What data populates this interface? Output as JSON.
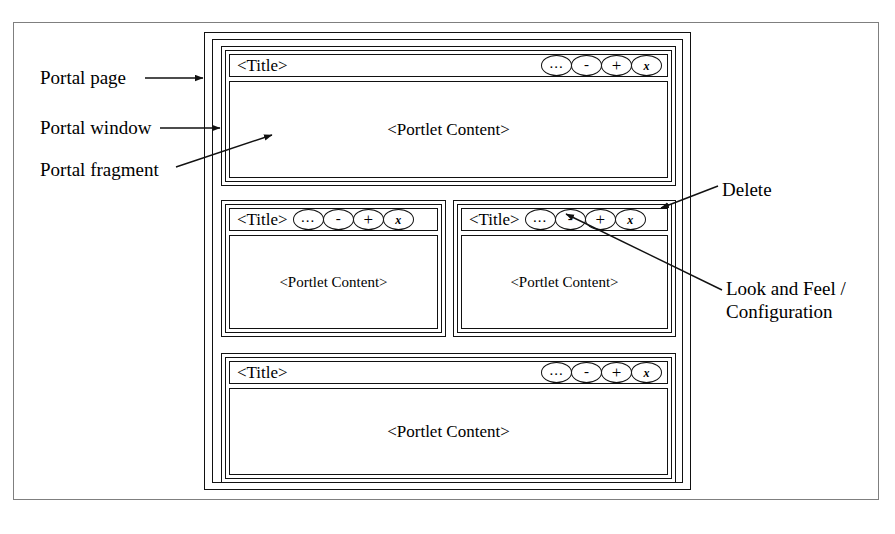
{
  "diagram": {
    "colors": {
      "stroke": "#111111",
      "page_border": "#7f7f7f",
      "background": "#ffffff"
    },
    "annotations": [
      {
        "id": "portal-page",
        "text": "Portal page",
        "points_to": "portal-page-frame"
      },
      {
        "id": "portal-window",
        "text": "Portal window",
        "points_to": "portal-window-border"
      },
      {
        "id": "portal-fragment",
        "text": "Portal fragment",
        "points_to": "portlet-content-area"
      },
      {
        "id": "delete",
        "text": "Delete",
        "points_to": "close-button"
      },
      {
        "id": "look-and-feel",
        "text_line1": "Look and Feel /",
        "text_line2": "Configuration",
        "points_to": "options-button"
      }
    ],
    "buttons": [
      {
        "name": "options-button",
        "label": "...",
        "title": "Look and Feel / Configuration"
      },
      {
        "name": "minimize-button",
        "label": "-",
        "title": "Minimize"
      },
      {
        "name": "maximize-button",
        "label": "+",
        "title": "Maximize"
      },
      {
        "name": "close-button",
        "label": "x",
        "title": "Delete"
      }
    ],
    "portlets": [
      {
        "id": "top",
        "title": "<Title>",
        "content": "<Portlet Content>",
        "layout": "spread"
      },
      {
        "id": "mid-left",
        "title": "<Title>",
        "content": "<Portlet Content>",
        "layout": "packed"
      },
      {
        "id": "mid-right",
        "title": "<Title>",
        "content": "<Portlet Content>",
        "layout": "packed"
      },
      {
        "id": "bottom",
        "title": "<Title>",
        "content": "<Portlet Content>",
        "layout": "spread"
      }
    ]
  }
}
